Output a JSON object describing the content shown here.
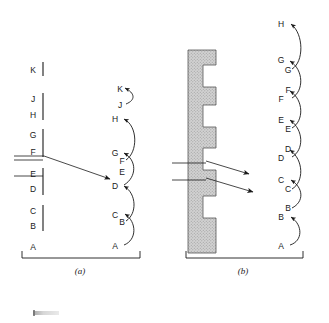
{
  "figure": {
    "type": "two-panel-schematic",
    "background": "#ffffff",
    "ink_color": "#1a1a1a",
    "block_fill": "#cfcfcf"
  },
  "panels": [
    {
      "id": "a",
      "caption": "(a)",
      "caption_x": 80,
      "caption_y": 272,
      "bracket": {
        "x1": 22,
        "x2": 140,
        "y": 258,
        "tick_height": 7
      },
      "left_column": {
        "name": "step-free-surface-levels",
        "label_x": 33,
        "levels": [
          {
            "label": "K",
            "y": 70
          },
          {
            "label": "J",
            "y": 99
          },
          {
            "label": "H",
            "y": 115
          },
          {
            "label": "G",
            "y": 135
          },
          {
            "label": "F",
            "y": 152
          },
          {
            "label": "E",
            "y": 174
          },
          {
            "label": "D",
            "y": 189
          },
          {
            "label": "C",
            "y": 211
          },
          {
            "label": "B",
            "y": 226
          },
          {
            "label": "A",
            "y": 247
          }
        ],
        "ticks": [
          {
            "x": 43,
            "y1": 62,
            "y2": 76
          },
          {
            "x": 43,
            "y1": 93,
            "y2": 120
          },
          {
            "x": 43,
            "y1": 129,
            "y2": 157
          },
          {
            "x": 43,
            "y1": 168,
            "y2": 195
          },
          {
            "x": 43,
            "y1": 205,
            "y2": 231
          }
        ],
        "lead_lines": [
          {
            "x1": 14,
            "y1": 160,
            "x2": 43,
            "y2": 160
          },
          {
            "x1": 14,
            "y1": 176,
            "x2": 43,
            "y2": 176
          }
        ]
      },
      "flux_arrow": {
        "name": "incident-flux-arrow",
        "path": "M 14,156 L 44,156 L 113,180",
        "arrowhead_at": [
          113,
          180
        ]
      },
      "right_column": {
        "name": "transition-ladder",
        "label_x": 118,
        "levels": [
          {
            "label": "K",
            "y": 89
          },
          {
            "label": "J",
            "y": 105
          },
          {
            "label": "H",
            "y": 119
          },
          {
            "label": "G",
            "y": 153
          },
          {
            "label": "F",
            "y": 161
          },
          {
            "label": "E",
            "y": 172
          },
          {
            "label": "D",
            "y": 186
          },
          {
            "label": "C",
            "y": 215
          },
          {
            "label": "B",
            "y": 222
          },
          {
            "label": "A",
            "y": 246
          }
        ],
        "hops": [
          {
            "from": "A",
            "to": "C"
          },
          {
            "from": "B",
            "to": "D"
          },
          {
            "from": "D",
            "to": "G"
          },
          {
            "from": "F",
            "to": "H"
          },
          {
            "from": "J",
            "to": "K"
          }
        ]
      }
    },
    {
      "id": "b",
      "caption": "(b)",
      "caption_x": 243,
      "caption_y": 272,
      "bracket": {
        "x1": 186,
        "x2": 303,
        "y": 258,
        "tick_height": 7
      },
      "stepped_block": {
        "name": "stepped-crystal-block",
        "x": 188,
        "y": 50,
        "width": 28,
        "height": 203,
        "fill": "#cfcfcf",
        "stroke": "#555555",
        "notches": [
          {
            "y": 65,
            "height": 22,
            "depth": 13
          },
          {
            "y": 105,
            "height": 22,
            "depth": 13
          },
          {
            "y": 148,
            "height": 22,
            "depth": 13
          },
          {
            "y": 196,
            "height": 22,
            "depth": 13
          }
        ]
      },
      "lead_lines": [
        {
          "x1": 172,
          "y1": 163,
          "x2": 205,
          "y2": 163
        },
        {
          "x1": 172,
          "y1": 180,
          "x2": 205,
          "y2": 180
        }
      ],
      "flux_arrows": [
        {
          "name": "flux-arrow-upper",
          "x1": 205,
          "y1": 161,
          "x2": 252,
          "y2": 175
        },
        {
          "name": "flux-arrow-lower",
          "x1": 205,
          "y1": 178,
          "x2": 256,
          "y2": 193
        }
      ],
      "right_column": {
        "name": "transition-ladder",
        "label_x": 278,
        "levels": [
          {
            "label": "H",
            "y": 24
          },
          {
            "label": "G",
            "y": 60
          },
          {
            "label": "G",
            "y": 70
          },
          {
            "label": "F",
            "y": 90
          },
          {
            "label": "F",
            "y": 99
          },
          {
            "label": "E",
            "y": 120
          },
          {
            "label": "E",
            "y": 129
          },
          {
            "label": "D",
            "y": 149
          },
          {
            "label": "D",
            "y": 158
          },
          {
            "label": "C",
            "y": 180
          },
          {
            "label": "C",
            "y": 189
          },
          {
            "label": "B",
            "y": 208
          },
          {
            "label": "B",
            "y": 217
          },
          {
            "label": "A",
            "y": 246
          }
        ],
        "hops": [
          {
            "from": "A",
            "to": "B"
          },
          {
            "from": "B",
            "to": "C"
          },
          {
            "from": "C",
            "to": "D"
          },
          {
            "from": "D",
            "to": "E"
          },
          {
            "from": "E",
            "to": "F"
          },
          {
            "from": "F",
            "to": "G"
          },
          {
            "from": "G",
            "to": "H"
          }
        ]
      }
    }
  ],
  "artifact": {
    "name": "scan-artifact",
    "visible": true
  }
}
